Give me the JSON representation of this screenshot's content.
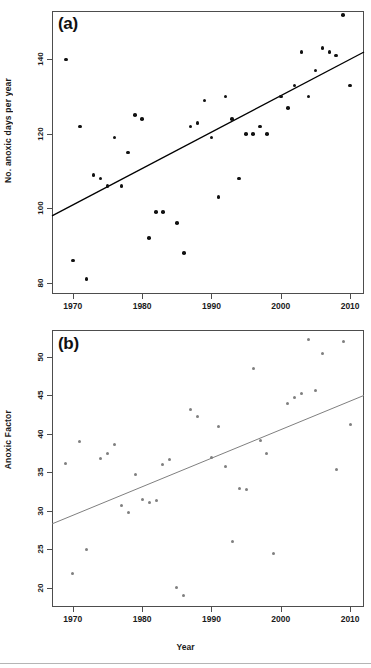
{
  "figure": {
    "panels": [
      {
        "tag": "(a)"
      },
      {
        "tag": "(b)"
      }
    ],
    "axis_label_x": "Year"
  },
  "chart_data": [
    {
      "type": "scatter",
      "panel": "(a)",
      "title": "(a)",
      "xlabel": "",
      "ylabel": "No. anoxic days per year",
      "xlim": [
        1967,
        2012
      ],
      "ylim": [
        77,
        153
      ],
      "xticks": [
        1970,
        1980,
        1990,
        2000,
        2010
      ],
      "yticks": [
        80,
        100,
        120,
        140
      ],
      "grid": false,
      "legend": "none",
      "point_color": "#111111",
      "line_color": "#000000",
      "x": [
        1969,
        1970,
        1971,
        1972,
        1973,
        1974,
        1975,
        1976,
        1977,
        1978,
        1979,
        1980,
        1981,
        1982,
        1983,
        1985,
        1986,
        1987,
        1988,
        1989,
        1990,
        1991,
        1992,
        1993,
        1994,
        1995,
        1996,
        1997,
        1998,
        2000,
        2001,
        2002,
        2003,
        2004,
        2005,
        2006,
        2007,
        2008,
        2009,
        2010
      ],
      "y": [
        140,
        86,
        122,
        81,
        109,
        108,
        106,
        119,
        106,
        115,
        125,
        124,
        92,
        99,
        99,
        96,
        88,
        122,
        123,
        129,
        119,
        103,
        130,
        124,
        108,
        120,
        120,
        122,
        120,
        130,
        127,
        133,
        142,
        130,
        137,
        143,
        142,
        141,
        152,
        133
      ],
      "trend": {
        "x": [
          1967,
          2012
        ],
        "y": [
          98,
          142
        ]
      }
    },
    {
      "type": "scatter",
      "panel": "(b)",
      "title": "(b)",
      "xlabel": "Year",
      "ylabel": "Anoxic Factor",
      "xlim": [
        1967,
        2012
      ],
      "ylim": [
        17.5,
        53.5
      ],
      "xticks": [
        1970,
        1980,
        1990,
        2000,
        2010
      ],
      "yticks": [
        20,
        25,
        30,
        35,
        40,
        45,
        50
      ],
      "grid": false,
      "legend": "none",
      "point_color": "#7f7f7f",
      "line_color": "#7f7f7f",
      "x": [
        1969,
        1970,
        1971,
        1972,
        1974,
        1975,
        1976,
        1977,
        1978,
        1979,
        1980,
        1981,
        1982,
        1983,
        1984,
        1985,
        1986,
        1987,
        1988,
        1990,
        1991,
        1992,
        1993,
        1994,
        1995,
        1996,
        1997,
        1998,
        1999,
        2001,
        2002,
        2003,
        2004,
        2005,
        2006,
        2008,
        2009,
        2010
      ],
      "y": [
        36.1,
        21.8,
        39.0,
        25.0,
        36.8,
        37.5,
        38.6,
        30.7,
        29.8,
        34.7,
        31.5,
        31.1,
        31.4,
        36.0,
        36.7,
        20.0,
        19.0,
        43.2,
        42.2,
        36.9,
        41.0,
        35.8,
        26.0,
        32.9,
        32.8,
        48.5,
        39.2,
        37.4,
        24.4,
        44.0,
        44.7,
        45.2,
        52.3,
        45.7,
        50.4,
        35.4,
        52.0,
        41.2
      ],
      "trend": {
        "x": [
          1967,
          2012
        ],
        "y": [
          28.3,
          45.0
        ]
      }
    }
  ]
}
